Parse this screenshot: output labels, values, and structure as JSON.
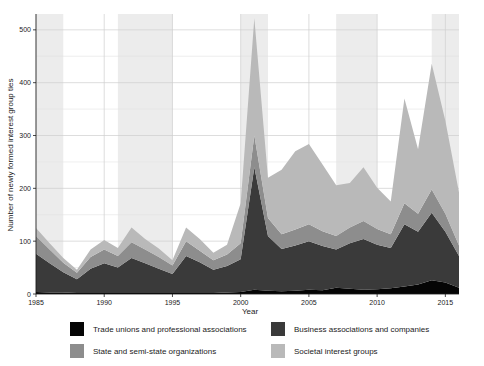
{
  "chart_data": {
    "type": "area",
    "title": "",
    "xlabel": "Year",
    "ylabel": "Number of newly formed interest group ties",
    "xlim": [
      1985,
      2016
    ],
    "ylim": [
      0,
      530
    ],
    "xticks": [
      1985,
      1990,
      1995,
      2000,
      2005,
      2010,
      2015
    ],
    "yticks": [
      0,
      100,
      200,
      300,
      400,
      500
    ],
    "yticks_minor": [
      50,
      150,
      250,
      350,
      450
    ],
    "grid": true,
    "stacked": true,
    "legend_position": "bottom",
    "legend_columns": 2,
    "x": [
      1985,
      1986,
      1987,
      1988,
      1989,
      1990,
      1991,
      1992,
      1993,
      1994,
      1995,
      1996,
      1997,
      1998,
      1999,
      2000,
      2001,
      2002,
      2003,
      2004,
      2005,
      2006,
      2007,
      2008,
      2009,
      2010,
      2011,
      2012,
      2013,
      2014,
      2015,
      2016
    ],
    "series": [
      {
        "name": "Trade unions and professional associations",
        "color": "#050505",
        "values": [
          4,
          3,
          3,
          2,
          2,
          2,
          2,
          2,
          2,
          2,
          2,
          2,
          2,
          2,
          3,
          4,
          8,
          6,
          5,
          6,
          8,
          7,
          12,
          10,
          8,
          9,
          11,
          14,
          18,
          26,
          22,
          12
        ]
      },
      {
        "name": "Business associations and companies",
        "color": "#3a3a3a",
        "values": [
          72,
          55,
          38,
          26,
          46,
          56,
          48,
          66,
          56,
          46,
          36,
          70,
          58,
          44,
          50,
          62,
          232,
          104,
          80,
          86,
          92,
          84,
          72,
          86,
          96,
          84,
          76,
          118,
          100,
          128,
          96,
          60
        ]
      },
      {
        "name": "State and semi-state organizations",
        "color": "#8d8d8d",
        "values": [
          34,
          26,
          18,
          12,
          22,
          26,
          22,
          30,
          26,
          22,
          16,
          28,
          22,
          18,
          22,
          30,
          60,
          34,
          28,
          30,
          32,
          28,
          26,
          30,
          34,
          30,
          26,
          40,
          34,
          44,
          34,
          20
        ]
      },
      {
        "name": "Societal interest groups",
        "color": "#b9b9b9",
        "values": [
          15,
          12,
          9,
          6,
          14,
          18,
          15,
          28,
          20,
          16,
          10,
          26,
          22,
          14,
          18,
          76,
          222,
          76,
          122,
          148,
          152,
          126,
          96,
          84,
          102,
          78,
          62,
          198,
          122,
          238,
          176,
          100
        ]
      }
    ],
    "band_shading": {
      "color": "#ececec",
      "intervals": [
        [
          1985,
          1987
        ],
        [
          1991,
          1995
        ],
        [
          2000,
          2002
        ],
        [
          2007,
          2010
        ],
        [
          2014,
          2016
        ]
      ]
    }
  },
  "axes": {
    "y_title": "Number of newly formed interest group ties",
    "x_title": "Year",
    "y_tick_labels": [
      "0",
      "100",
      "200",
      "300",
      "400",
      "500"
    ],
    "x_tick_labels": [
      "1985",
      "1990",
      "1995",
      "2000",
      "2005",
      "2010",
      "2015"
    ]
  },
  "legend": {
    "items": [
      {
        "label": "Trade unions and professional associations",
        "color": "#050505"
      },
      {
        "label": "Business associations and companies",
        "color": "#3a3a3a"
      },
      {
        "label": "State and semi-state organizations",
        "color": "#8d8d8d"
      },
      {
        "label": "Societal interest groups",
        "color": "#b9b9b9"
      }
    ]
  }
}
